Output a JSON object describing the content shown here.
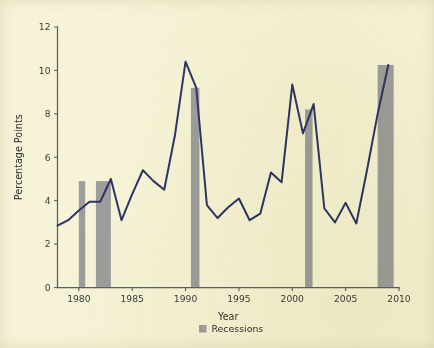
{
  "chart_data": {
    "type": "line",
    "title": "",
    "subtitle": "",
    "xlabel": "Year",
    "ylabel": "Percentage Points",
    "xlim": [
      1978,
      2010
    ],
    "ylim": [
      0,
      12
    ],
    "grid": false,
    "legend_position": "bottom-center",
    "x_ticks": [
      1980,
      1985,
      1990,
      1995,
      2000,
      2005,
      2010
    ],
    "x_tick_labels": [
      "1980",
      "1985",
      "1990",
      "1995",
      "2000",
      "2005",
      "2010"
    ],
    "y_ticks": [
      0,
      2,
      4,
      6,
      8,
      10,
      12
    ],
    "y_tick_labels": [
      "0",
      "2",
      "4",
      "6",
      "8",
      "10",
      "12"
    ],
    "series": [
      {
        "name": "Percentage Points",
        "color": "#2e3563",
        "x": [
          1978,
          1979,
          1980,
          1981,
          1982,
          1983,
          1984,
          1985,
          1986,
          1987,
          1988,
          1989,
          1990,
          1991,
          1992,
          1993,
          1994,
          1995,
          1996,
          1997,
          1998,
          1999,
          2000,
          2001,
          2002,
          2003,
          2004,
          2005,
          2006,
          2007,
          2008,
          2009
        ],
        "values": [
          2.85,
          3.1,
          3.55,
          3.95,
          3.95,
          5.0,
          3.1,
          4.3,
          5.4,
          4.9,
          4.5,
          7.0,
          10.4,
          9.2,
          3.8,
          3.2,
          3.7,
          4.1,
          3.1,
          3.4,
          5.3,
          4.85,
          9.35,
          7.1,
          8.45,
          3.65,
          3.0,
          3.9,
          2.95,
          5.4,
          8.0,
          10.25
        ]
      }
    ],
    "recession_bands": [
      {
        "label": "Recessions",
        "start": 1980.0,
        "end": 1980.6,
        "top": 4.9
      },
      {
        "label": "Recessions",
        "start": 1981.6,
        "end": 1983.0,
        "top": 4.9
      },
      {
        "label": "Recessions",
        "start": 1990.5,
        "end": 1991.3,
        "top": 9.2
      },
      {
        "label": "Recessions",
        "start": 2001.2,
        "end": 2001.9,
        "top": 8.2
      },
      {
        "label": "Recessions",
        "start": 2008.0,
        "end": 2009.5,
        "top": 10.25
      }
    ],
    "legend": [
      {
        "label": "Recessions",
        "color": "#9d9d9d",
        "marker": "square"
      }
    ],
    "colors": {
      "background": "#f6f3d8",
      "line": "#2e3563",
      "recession": "#9d9d9d",
      "axis": "#5d5f63",
      "text": "#2f2e2a"
    }
  }
}
